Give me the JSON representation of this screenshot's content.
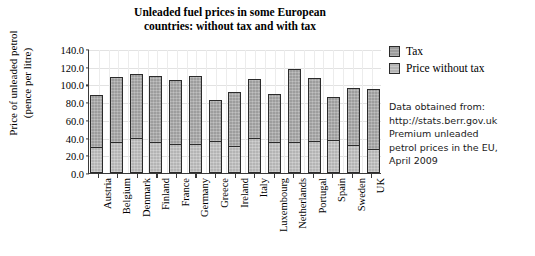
{
  "chart_data": {
    "type": "bar",
    "subtype": "stacked-vertical",
    "title": "Unleaded fuel prices in some European\ncountries: without tax and with tax",
    "xlabel": "",
    "ylabel": "Price of unleaded petrol\n(pence per litre)",
    "ylim": [
      0.0,
      140.0
    ],
    "ytick_step": 20.0,
    "ytick_labels": [
      "140.0",
      "120.0",
      "100.0",
      "80.0",
      "60.0",
      "40.0",
      "20.0",
      "0.0"
    ],
    "ytick_values": [
      140.0,
      120.0,
      100.0,
      80.0,
      60.0,
      40.0,
      20.0,
      0.0
    ],
    "grid": true,
    "legend_position": "right",
    "categories": [
      "Austria",
      "Belgium",
      "Denmark",
      "Finland",
      "France",
      "Germany",
      "Greece",
      "Ireland",
      "Italy",
      "Luxembourg",
      "Netherlands",
      "Portugal",
      "Spain",
      "Sweden",
      "UK"
    ],
    "series": [
      {
        "name": "Price without tax",
        "color": "#b4b4b4",
        "values": [
          29.5,
          35.5,
          39.5,
          35.5,
          33.0,
          32.5,
          36.0,
          30.5,
          39.5,
          35.0,
          35.5,
          36.5,
          37.0,
          32.0,
          27.5
        ]
      },
      {
        "name": "Tax",
        "color": "#9d9d9d",
        "values": [
          58.5,
          73.0,
          72.5,
          74.5,
          72.0,
          76.5,
          46.5,
          61.5,
          67.0,
          54.0,
          81.5,
          70.5,
          48.5,
          64.5,
          67.5
        ]
      }
    ],
    "totals": [
      88.0,
      108.5,
      112.0,
      110.0,
      105.0,
      109.0,
      82.5,
      92.0,
      106.5,
      89.0,
      117.0,
      107.0,
      85.5,
      96.5,
      95.0
    ]
  },
  "legend": {
    "items": [
      {
        "label": "Tax",
        "swatch": "tax"
      },
      {
        "label": "Price without tax",
        "swatch": "base"
      }
    ]
  },
  "source_note": {
    "text": "Data obtained from:\nhttp://stats.berr.gov.uk\nPremium unleaded\npetrol prices in the EU,\nApril 2009"
  },
  "colors": {
    "tax": "#9d9d9d",
    "price_without_tax": "#b4b4b4",
    "axis": "#3a3a3a",
    "bar_outline": "#2b2b2b",
    "gridline": "#e2e2e2",
    "background": "#ffffff"
  }
}
